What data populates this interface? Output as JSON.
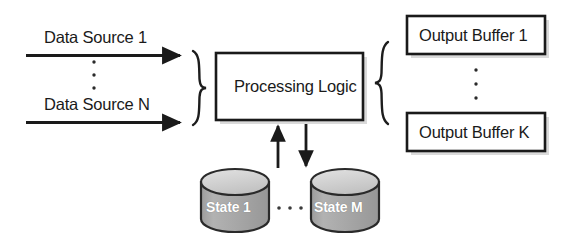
{
  "diagram": {
    "colors": {
      "stroke": "#1a1a1a",
      "text": "#1a1a1a",
      "box_fill": "#ffffff",
      "cylinder_body": "#a8a8a8",
      "cylinder_top": "#d4d4d4",
      "cylinder_label_text": "#ffffff",
      "shadow": "#b9b9b9",
      "background": "#ffffff"
    },
    "inputs": {
      "group_brace": "}",
      "vertical_ellipsis": "⋮",
      "items": [
        {
          "label": "Data Source 1",
          "arrow": "arrow-right"
        },
        {
          "label": "Data Source N",
          "arrow": "arrow-right"
        }
      ]
    },
    "processing": {
      "label": "Processing Logic"
    },
    "outputs": {
      "group_brace": "{",
      "vertical_ellipsis": "⋮",
      "items": [
        {
          "label": "Output Buffer 1"
        },
        {
          "label": "Output Buffer K"
        }
      ]
    },
    "state": {
      "horizontal_ellipsis": "· · ·",
      "items": [
        {
          "label": "State 1"
        },
        {
          "label": "State M"
        }
      ],
      "arrows": [
        {
          "name": "state-read-arrow",
          "direction": "up"
        },
        {
          "name": "state-write-arrow",
          "direction": "down"
        }
      ]
    }
  }
}
